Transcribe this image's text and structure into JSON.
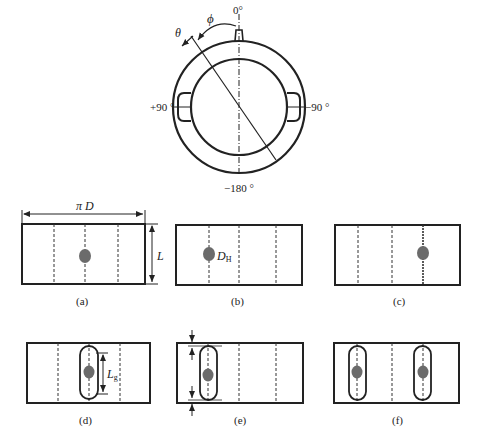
{
  "figure": {
    "top_view": {
      "angle_labels": {
        "top": "0°",
        "left": "+90 °",
        "right": "−90 °",
        "bottom": "−180 °"
      },
      "symbols": {
        "theta": "θ",
        "phi": "ϕ"
      }
    },
    "panels": [
      {
        "id": "a",
        "caption": "(a)",
        "annotations": {
          "width": "π D",
          "height": "L"
        }
      },
      {
        "id": "b",
        "caption": "(b)",
        "annotations": {
          "hole": "D",
          "hole_sub": "H"
        }
      },
      {
        "id": "c",
        "caption": "(c)"
      },
      {
        "id": "d",
        "caption": "(d)",
        "annotations": {
          "groove_length": "L",
          "groove_sub": "g"
        }
      },
      {
        "id": "e",
        "caption": "(e)"
      },
      {
        "id": "f",
        "caption": "(f)"
      }
    ],
    "colors": {
      "line": "#222222",
      "hole_fill": "#6b6b6b",
      "background": "#ffffff"
    }
  }
}
